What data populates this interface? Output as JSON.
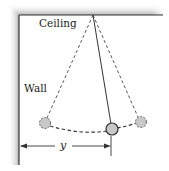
{
  "diagram": {
    "labels": {
      "ceiling": "Ceiling",
      "wall": "Wall",
      "distance": "y"
    },
    "colors": {
      "line": "#333333",
      "ball_fill": "#c8c8c8",
      "ball_stroke": "#444444",
      "shadow": "#bdbdbd"
    },
    "elements": {
      "pivot": {
        "x": 93,
        "y": 15
      },
      "balls": [
        {
          "name": "left-extreme",
          "x": 45,
          "y": 123,
          "style": "dashed"
        },
        {
          "name": "current",
          "x": 112,
          "y": 129,
          "style": "solid"
        },
        {
          "name": "right-extreme",
          "x": 141,
          "y": 122,
          "style": "dashed"
        }
      ]
    }
  }
}
